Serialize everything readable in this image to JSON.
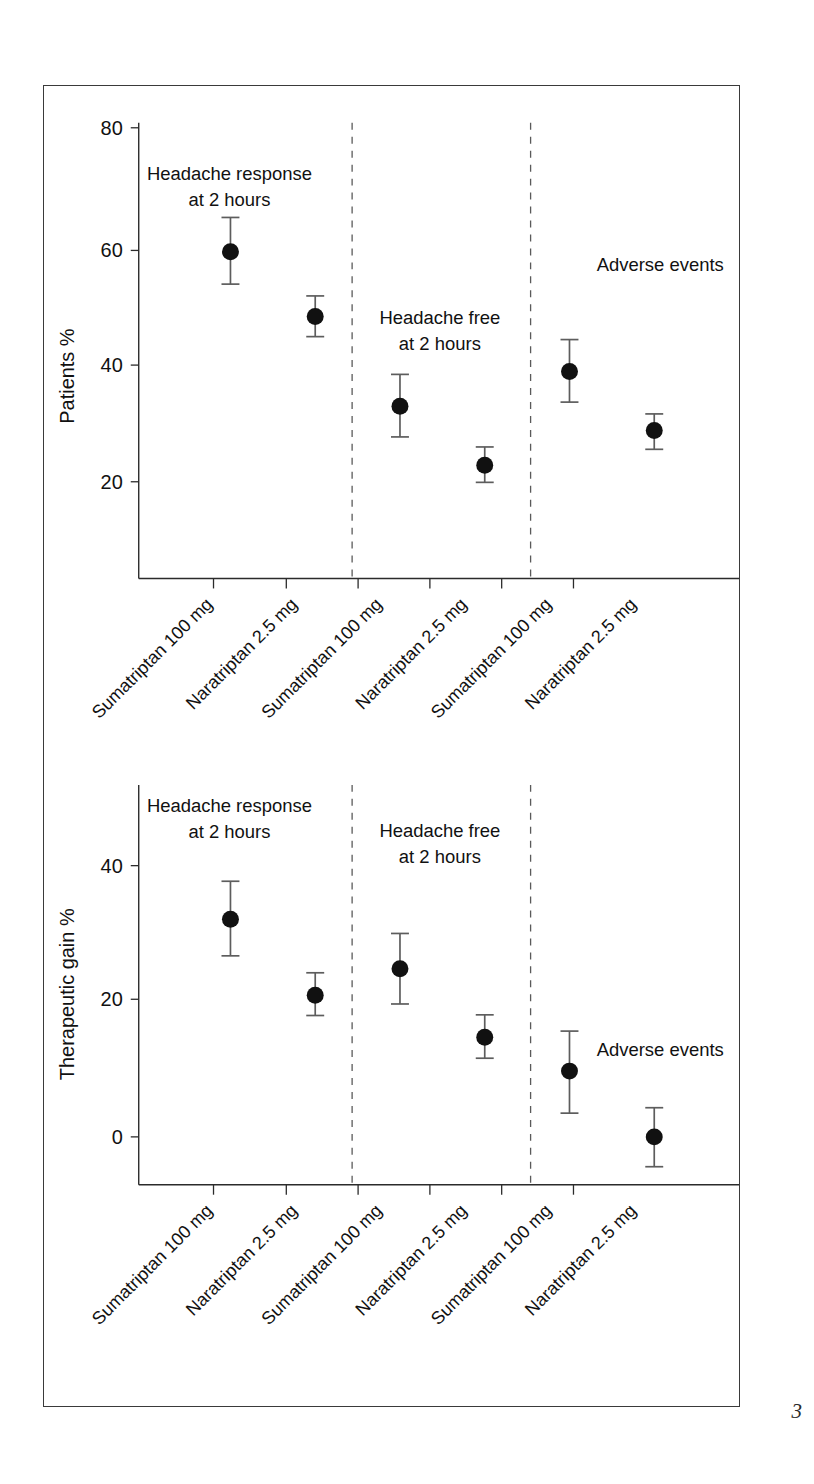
{
  "figure": {
    "page_number": "3",
    "categories": [
      "Sumatriptan 100 mg",
      "Naratriptan 2.5 mg",
      "Sumatriptan 100 mg",
      "Naratriptan 2.5 mg",
      "Sumatriptan 100 mg",
      "Naratriptan 2.5 mg"
    ],
    "group_labels": [
      {
        "line1": "Headache response",
        "line2": "at 2 hours"
      },
      {
        "line1": "Headache free",
        "line2": "at 2 hours"
      },
      {
        "line1": "Adverse events",
        "line2": ""
      }
    ]
  },
  "chart_data": [
    {
      "type": "scatter",
      "title": "",
      "ylabel": "Patients %",
      "xlabel": "",
      "ylim": [
        10,
        80
      ],
      "yticks": [
        20,
        40,
        60,
        80
      ],
      "ytick_labels": [
        "20",
        "40",
        "60",
        "80"
      ],
      "grid": false,
      "legend": "none",
      "annotations": [
        "Headache response at 2 hours",
        "Headache free at 2 hours",
        "Adverse events"
      ],
      "categories": [
        "Sumatriptan 100 mg",
        "Naratriptan 2.5 mg",
        "Sumatriptan 100 mg",
        "Naratriptan 2.5 mg",
        "Sumatriptan 100 mg",
        "Naratriptan 2.5 mg"
      ],
      "values": [
        59.0,
        48.0,
        32.8,
        22.8,
        38.7,
        28.7
      ],
      "ci_low": [
        53.5,
        44.6,
        27.6,
        19.9,
        33.5,
        25.5
      ],
      "ci_high": [
        64.8,
        51.5,
        38.2,
        25.9,
        44.1,
        31.5
      ],
      "group_dividers": [
        2,
        4
      ]
    },
    {
      "type": "scatter",
      "title": "",
      "ylabel": "Therapeutic gain %",
      "xlabel": "",
      "ylim": [
        -9,
        47
      ],
      "yticks": [
        0,
        20,
        40
      ],
      "ytick_labels": [
        "0",
        "20",
        "40"
      ],
      "grid": false,
      "legend": "none",
      "annotations": [
        "Headache response at 2 hours",
        "Headache free at 2 hours",
        "Adverse events"
      ],
      "categories": [
        "Sumatriptan 100 mg",
        "Naratriptan 2.5 mg",
        "Sumatriptan 100 mg",
        "Naratriptan 2.5 mg",
        "Sumatriptan 100 mg",
        "Naratriptan 2.5 mg"
      ],
      "values": [
        32.1,
        20.9,
        24.8,
        14.7,
        9.7,
        0.0
      ],
      "ci_low": [
        26.7,
        17.9,
        19.6,
        11.6,
        3.5,
        -4.4
      ],
      "ci_high": [
        37.7,
        24.2,
        30.0,
        18.0,
        15.6,
        4.3
      ],
      "group_dividers": [
        2,
        4
      ]
    }
  ]
}
